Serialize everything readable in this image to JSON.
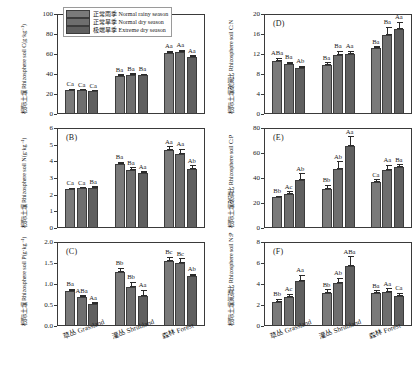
{
  "figure": {
    "group_labels": [
      "草丛 Grassland",
      "灌丛 Shrubland",
      "森林 Forest"
    ],
    "legend": [
      {
        "label": "正常雨季 Normal rainy season",
        "color": "#7a7a7a"
      },
      {
        "label": "正常旱季 Normal dry season",
        "color": "#6e6e6e"
      },
      {
        "label": "极端旱季 Extreme dry season",
        "color": "#5f5f5f"
      }
    ]
  },
  "chart_data": [
    {
      "type": "bar",
      "panel": "(A)",
      "title": "",
      "ylabel": "根际土壤 Rhizosphere soil C(g·kg⁻¹)",
      "xlabel": "",
      "categories": [
        "草丛 Grassland",
        "灌丛 Shrubland",
        "森林 Forest"
      ],
      "ylim": [
        0,
        100
      ],
      "yticks": [
        0,
        20,
        40,
        60,
        80,
        100
      ],
      "grid": false,
      "legend_position": "top-center",
      "series": [
        {
          "name": "正常雨季 Normal rainy season",
          "values": [
            24.5,
            38.0,
            61.0
          ],
          "errors": [
            1.0,
            1.6,
            2.2
          ]
        },
        {
          "name": "正常旱季 Normal dry season",
          "values": [
            24.0,
            39.0,
            62.0
          ],
          "errors": [
            1.0,
            1.8,
            2.4
          ]
        },
        {
          "name": "极端旱季 Extreme dry season",
          "values": [
            22.8,
            38.8,
            57.0
          ],
          "errors": [
            0.9,
            1.6,
            2.0
          ]
        }
      ],
      "annotations": [
        [
          "Ca",
          "Ca",
          "Ca"
        ],
        [
          "Ba",
          "Ba",
          "Ba"
        ],
        [
          "Aa",
          "Aa",
          "Aa"
        ]
      ]
    },
    {
      "type": "bar",
      "panel": "(B)",
      "title": "",
      "ylabel": "根际土壤 Rhizosphere soil N(g·kg⁻¹)",
      "xlabel": "",
      "categories": [
        "草丛 Grassland",
        "灌丛 Shrubland",
        "森林 Forest"
      ],
      "ylim": [
        0,
        6
      ],
      "yticks": [
        0,
        1,
        2,
        3,
        4,
        5,
        6
      ],
      "grid": false,
      "legend_position": "none",
      "series": [
        {
          "name": "正常雨季 Normal rainy season",
          "values": [
            2.32,
            3.85,
            4.7
          ],
          "errors": [
            0.1,
            0.13,
            0.22
          ]
        },
        {
          "name": "正常旱季 Normal dry season",
          "values": [
            2.38,
            3.5,
            4.45
          ],
          "errors": [
            0.08,
            0.14,
            0.3
          ]
        },
        {
          "name": "极端旱季 Extreme dry season",
          "values": [
            2.43,
            3.3,
            3.52
          ],
          "errors": [
            0.09,
            0.12,
            0.26
          ]
        }
      ],
      "annotations": [
        [
          "Ca",
          "Ca",
          "Ba"
        ],
        [
          "Ba",
          "Ba",
          "Aa"
        ],
        [
          "Aa",
          "Aa",
          "Ab"
        ]
      ]
    },
    {
      "type": "bar",
      "panel": "(C)",
      "title": "",
      "ylabel": "根际土壤 Rhizosphere soil P(g·kg⁻¹)",
      "xlabel": "",
      "categories": [
        "草丛 Grassland",
        "灌丛 Shrubland",
        "森林 Forest"
      ],
      "ylim": [
        0,
        2.0
      ],
      "yticks": [
        0.0,
        0.5,
        1.0,
        1.5,
        2.0
      ],
      "grid": false,
      "legend_position": "none",
      "series": [
        {
          "name": "正常雨季 Normal rainy season",
          "values": [
            0.84,
            1.28,
            1.55
          ],
          "errors": [
            0.05,
            0.11,
            0.1
          ]
        },
        {
          "name": "正常旱季 Normal dry season",
          "values": [
            0.69,
            0.93,
            1.49
          ],
          "errors": [
            0.04,
            0.13,
            0.12
          ]
        },
        {
          "name": "极端旱季 Extreme dry season",
          "values": [
            0.53,
            0.72,
            1.19
          ],
          "errors": [
            0.04,
            0.14,
            0.06
          ]
        }
      ],
      "annotations": [
        [
          "Ba",
          "ABa",
          "Aa"
        ],
        [
          "Bb",
          "Bb",
          "Aa"
        ],
        [
          "Bc",
          "Bc",
          "Ab"
        ]
      ]
    },
    {
      "type": "bar",
      "panel": "(D)",
      "title": "",
      "ylabel": "根际土壤碳氮比 Rhizosphere soil C:N",
      "xlabel": "",
      "categories": [
        "草丛 Grassland",
        "灌丛 Shrubland",
        "森林 Forest"
      ],
      "ylim": [
        0,
        20
      ],
      "yticks": [
        0,
        4,
        8,
        12,
        16,
        20
      ],
      "grid": false,
      "legend_position": "none",
      "series": [
        {
          "name": "正常雨季 Normal rainy season",
          "values": [
            10.7,
            9.9,
            13.2
          ],
          "errors": [
            0.6,
            0.5,
            0.4
          ]
        },
        {
          "name": "正常旱季 Normal dry season",
          "values": [
            10.0,
            11.8,
            15.9
          ],
          "errors": [
            0.5,
            0.9,
            1.6
          ]
        },
        {
          "name": "极端旱季 Extreme dry season",
          "values": [
            9.3,
            12.1,
            17.1
          ],
          "errors": [
            0.4,
            0.6,
            1.4
          ]
        }
      ],
      "annotations": [
        [
          "ABa",
          "Ba",
          "Ab"
        ],
        [
          "Ba",
          "Ba",
          "Aa"
        ],
        [
          "Ba",
          "Ba",
          "Aa"
        ]
      ]
    },
    {
      "type": "bar",
      "panel": "(E)",
      "title": "",
      "ylabel": "根际土壤碳磷比 Rhizosphere soil C:P",
      "xlabel": "",
      "categories": [
        "草丛 Grassland",
        "灌丛 Shrubland",
        "森林 Forest"
      ],
      "ylim": [
        0,
        80
      ],
      "yticks": [
        0,
        20,
        40,
        60,
        80
      ],
      "grid": false,
      "legend_position": "none",
      "series": [
        {
          "name": "正常雨季 Normal rainy season",
          "values": [
            24.5,
            31.5,
            36.5
          ],
          "errors": [
            1.5,
            3.0,
            2.5
          ]
        },
        {
          "name": "正常旱季 Normal dry season",
          "values": [
            27.5,
            47.0,
            46.5
          ],
          "errors": [
            2.0,
            6.5,
            4.0
          ]
        },
        {
          "name": "极端旱季 Extreme dry season",
          "values": [
            38.5,
            65.5,
            48.5
          ],
          "errors": [
            5.5,
            8.0,
            2.5
          ]
        }
      ],
      "annotations": [
        [
          "Bb",
          "Ac",
          "Ab"
        ],
        [
          "Bb",
          "Ab",
          "Aa"
        ],
        [
          "Ca",
          "Aa",
          "Ba"
        ]
      ]
    },
    {
      "type": "bar",
      "panel": "(F)",
      "title": "",
      "ylabel": "根际土壤氮磷比 Rhizosphere soil N:P",
      "xlabel": "",
      "categories": [
        "草丛 Grassland",
        "灌丛 Shrubland",
        "森林 Forest"
      ],
      "ylim": [
        0,
        8
      ],
      "yticks": [
        0,
        2,
        4,
        6,
        8
      ],
      "grid": false,
      "legend_position": "none",
      "series": [
        {
          "name": "正常雨季 Normal rainy season",
          "values": [
            2.32,
            3.1,
            3.1
          ],
          "errors": [
            0.3,
            0.4,
            0.3
          ]
        },
        {
          "name": "正常旱季 Normal dry season",
          "values": [
            2.8,
            4.05,
            3.28
          ],
          "errors": [
            0.25,
            0.55,
            0.32
          ]
        },
        {
          "name": "极端旱季 Extreme dry season",
          "values": [
            4.25,
            5.7,
            2.9
          ],
          "errors": [
            0.65,
            0.95,
            0.25
          ]
        }
      ],
      "annotations": [
        [
          "Bb",
          "Ac",
          "Aa"
        ],
        [
          "Bb",
          "Ab",
          "ABa"
        ],
        [
          "Ba",
          "Aa",
          "Ca"
        ]
      ]
    }
  ]
}
